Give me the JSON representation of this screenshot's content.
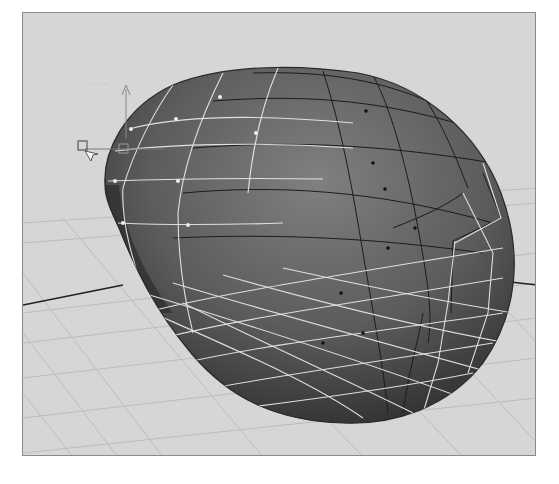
{
  "viewport": {
    "type": "3d-perspective-viewport",
    "background_color": "#d6d6d6",
    "border_color": "#8a8a8a"
  },
  "scene": {
    "object": "deformed-sphere-surface",
    "surface_color_light": "#7a7a7a",
    "surface_color_dark": "#2e2e2e",
    "wire_color_selected": "#e8e8e8",
    "wire_color_unselected": "#1e1e1e",
    "ground_grid_color": "#bdbdbd",
    "axis_line_color": "#222222"
  },
  "manipulator": {
    "kind": "pivot-manipulator",
    "label": "······"
  }
}
